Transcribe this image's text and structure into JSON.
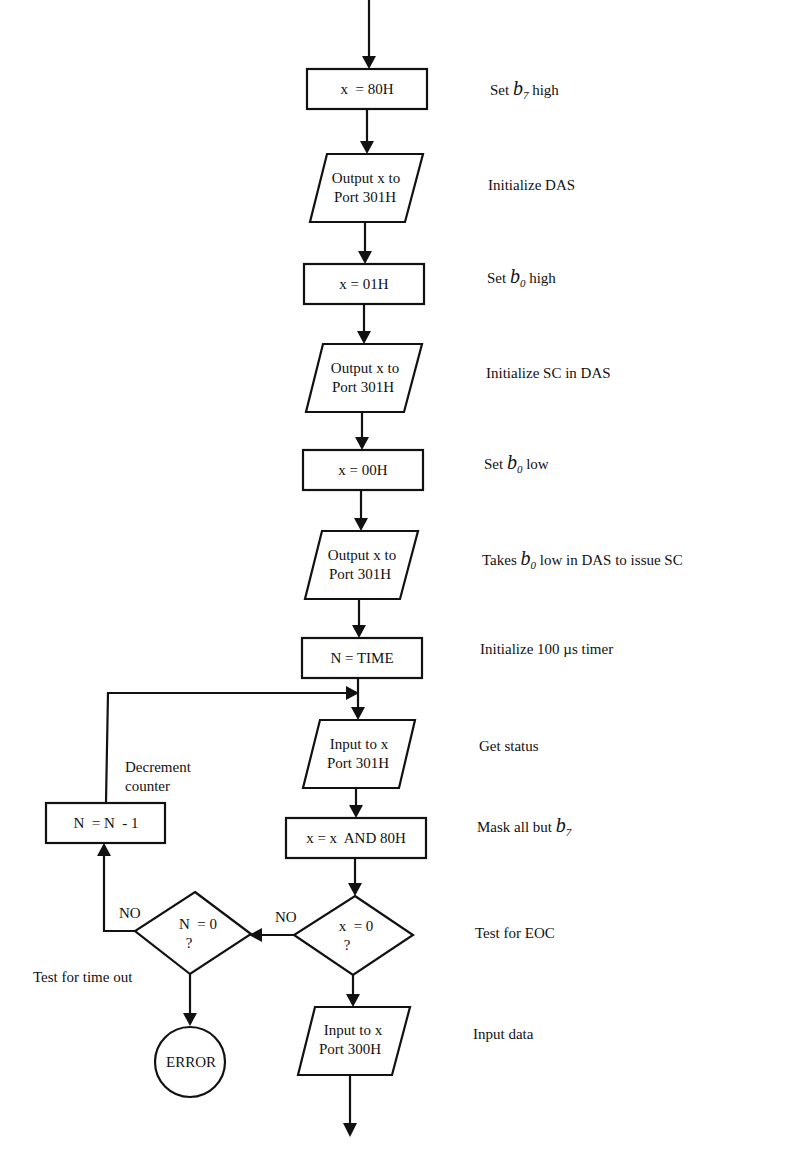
{
  "diagram": {
    "type": "flowchart",
    "nodes": [
      {
        "id": "n1",
        "shape": "process",
        "lines": [
          "x  = 80H"
        ]
      },
      {
        "id": "n2",
        "shape": "io",
        "lines": [
          "Output x to",
          "Port 301H"
        ]
      },
      {
        "id": "n3",
        "shape": "process",
        "lines": [
          "x = 01H"
        ]
      },
      {
        "id": "n4",
        "shape": "io",
        "lines": [
          "Output x to",
          "Port 301H"
        ]
      },
      {
        "id": "n5",
        "shape": "process",
        "lines": [
          "x = 00H"
        ]
      },
      {
        "id": "n6",
        "shape": "io",
        "lines": [
          "Output x to",
          "Port 301H"
        ]
      },
      {
        "id": "n7",
        "shape": "process",
        "lines": [
          "N = TIME"
        ]
      },
      {
        "id": "n8",
        "shape": "io",
        "lines": [
          "Input to x",
          "Port 301H"
        ]
      },
      {
        "id": "n9",
        "shape": "process",
        "lines": [
          "x = x  AND 80H"
        ]
      },
      {
        "id": "n10",
        "shape": "decision",
        "lines": [
          "x  = 0",
          "?"
        ]
      },
      {
        "id": "n11",
        "shape": "decision",
        "lines": [
          "N  = 0",
          "?"
        ]
      },
      {
        "id": "n12",
        "shape": "process",
        "lines": [
          "N  = N  - 1"
        ]
      },
      {
        "id": "n13",
        "shape": "terminal",
        "lines": [
          "ERROR"
        ]
      },
      {
        "id": "n14",
        "shape": "io",
        "lines": [
          "Input to x",
          "Port 300H"
        ]
      }
    ],
    "edge_labels": {
      "x_zero_no": "NO",
      "n_zero_no": "NO"
    },
    "side_labels": {
      "decrement": [
        "Decrement",
        "counter"
      ],
      "timeout": "Test for time out"
    },
    "annotations": [
      {
        "pre": "Set ",
        "sym": "b",
        "sub": "7",
        "post": " high"
      },
      {
        "pre": "Initialize DAS",
        "sym": "",
        "sub": "",
        "post": ""
      },
      {
        "pre": "Set ",
        "sym": "b",
        "sub": "0",
        "post": " high"
      },
      {
        "pre": "Initialize SC in DAS",
        "sym": "",
        "sub": "",
        "post": ""
      },
      {
        "pre": "Set ",
        "sym": "b",
        "sub": "0",
        "post": " low"
      },
      {
        "pre": "Takes ",
        "sym": "b",
        "sub": "0",
        "post": " low in DAS to issue SC"
      },
      {
        "pre": "Initialize 100 µs timer",
        "sym": "",
        "sub": "",
        "post": ""
      },
      {
        "pre": "Get status",
        "sym": "",
        "sub": "",
        "post": ""
      },
      {
        "pre": "Mask all but ",
        "sym": "b",
        "sub": "7",
        "post": ""
      },
      {
        "pre": "Test for EOC",
        "sym": "",
        "sub": "",
        "post": ""
      },
      {
        "pre": "Input data",
        "sym": "",
        "sub": "",
        "post": ""
      }
    ],
    "colors": {
      "ink": "#111111",
      "background": "#ffffff"
    }
  }
}
